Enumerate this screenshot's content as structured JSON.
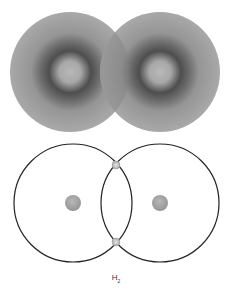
{
  "diagram": {
    "top_panel": {
      "description": "Electron density clouds of two overlapping hydrogen atoms",
      "atoms": [
        {
          "cx": 70,
          "cy": 72,
          "r": 60
        },
        {
          "cx": 160,
          "cy": 72,
          "r": 60
        }
      ],
      "colors": {
        "cloud": "#a8a8a8",
        "ring": "#4a4a4a",
        "center": "#b4b4b4",
        "overlap": "#8a8a8a"
      }
    },
    "bottom_panel": {
      "description": "Orbit diagram of H2 molecule with shared electron pair",
      "orbits": [
        {
          "cx": 73,
          "cy": 203,
          "r": 59
        },
        {
          "cx": 160,
          "cy": 203,
          "r": 59
        }
      ],
      "nuclei": [
        {
          "cx": 73,
          "cy": 203,
          "r": 8
        },
        {
          "cx": 160,
          "cy": 203,
          "r": 8
        }
      ],
      "electrons": [
        {
          "cx": 116,
          "cy": 165,
          "r": 4
        },
        {
          "cx": 116,
          "cy": 242,
          "r": 4
        }
      ],
      "colors": {
        "orbit": "#222222",
        "nucleus": "#a0a0a0",
        "electron": "#b0b0b0"
      }
    },
    "label": {
      "main": "H",
      "subscript": "2"
    }
  }
}
